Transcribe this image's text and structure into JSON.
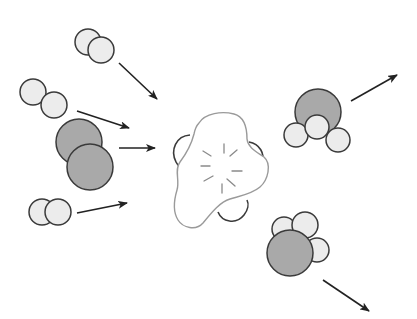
{
  "diagram": {
    "colors": {
      "background": "#ffffff",
      "white_atom_fill": "#ececec",
      "gray_atom_fill": "#a9a9a9",
      "outline": "#3a3a3a",
      "catalyst_outline": "#9a9a9a",
      "catalyst_back_outline": "#3a3a3a",
      "arrow": "#222222"
    },
    "reactants": [
      {
        "name": "reactant-diatomic-top",
        "atoms": [
          {
            "cx": 88,
            "cy": 42,
            "r": 13,
            "type": "white"
          },
          {
            "cx": 101,
            "cy": 50,
            "r": 13,
            "type": "white"
          }
        ],
        "arrow": {
          "x1": 119,
          "y1": 63,
          "x2": 157,
          "y2": 99
        }
      },
      {
        "name": "reactant-diatomic-second",
        "atoms": [
          {
            "cx": 33,
            "cy": 92,
            "r": 13,
            "type": "white"
          },
          {
            "cx": 54,
            "cy": 105,
            "r": 13,
            "type": "white"
          }
        ],
        "arrow": {
          "x1": 77,
          "y1": 111,
          "x2": 129,
          "y2": 128
        }
      },
      {
        "name": "reactant-diatomic-gray",
        "atoms": [
          {
            "cx": 79,
            "cy": 142,
            "r": 23,
            "type": "gray"
          },
          {
            "cx": 90,
            "cy": 167,
            "r": 23,
            "type": "gray"
          }
        ],
        "arrow": {
          "x1": 119,
          "y1": 148,
          "x2": 155,
          "y2": 148
        }
      },
      {
        "name": "reactant-diatomic-bottom",
        "atoms": [
          {
            "cx": 42,
            "cy": 212,
            "r": 13,
            "type": "white"
          },
          {
            "cx": 58,
            "cy": 212,
            "r": 13,
            "type": "white"
          }
        ],
        "arrow": {
          "x1": 77,
          "y1": 213,
          "x2": 127,
          "y2": 203
        }
      }
    ],
    "products": [
      {
        "name": "product-molecule-upper",
        "atoms": [
          {
            "cx": 318,
            "cy": 112,
            "r": 23,
            "type": "gray"
          },
          {
            "cx": 296,
            "cy": 135,
            "r": 12,
            "type": "white"
          },
          {
            "cx": 338,
            "cy": 140,
            "r": 12,
            "type": "white"
          },
          {
            "cx": 317,
            "cy": 127,
            "r": 12,
            "type": "white"
          }
        ],
        "arrow": {
          "x1": 351,
          "y1": 101,
          "x2": 397,
          "y2": 75
        }
      },
      {
        "name": "product-molecule-lower",
        "atoms": [
          {
            "cx": 284,
            "cy": 229,
            "r": 12,
            "type": "white"
          },
          {
            "cx": 317,
            "cy": 250,
            "r": 12,
            "type": "white"
          },
          {
            "cx": 305,
            "cy": 225,
            "r": 13,
            "type": "white"
          },
          {
            "cx": 290,
            "cy": 253,
            "r": 23,
            "type": "gray"
          }
        ],
        "arrow": {
          "x1": 323,
          "y1": 280,
          "x2": 369,
          "y2": 311
        }
      }
    ],
    "catalyst": {
      "label": "catalyst",
      "center": {
        "cx": 222,
        "cy": 172
      },
      "spark_lines": 8
    }
  }
}
